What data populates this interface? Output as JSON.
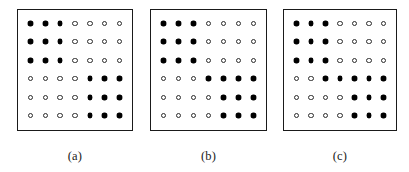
{
  "figure": {
    "marker_filled_name": "filled-dot",
    "marker_open_name": "open-dot",
    "colors": {
      "background": "#ffffff",
      "border": "#1a1a1a",
      "filled_marker": "#000000",
      "open_marker_outline": "#2b2b2b",
      "caption_text": "#1a1a1a"
    }
  },
  "chart_data": {
    "type": "heatmap",
    "title": "",
    "xlabel": "",
    "ylabel": "",
    "grid": false,
    "legend": {
      "position": "none",
      "entries": [
        {
          "symbol": "filled-dot",
          "value": 1
        },
        {
          "symbol": "open-dot",
          "value": 0
        }
      ]
    },
    "columns": 7,
    "rows": 6,
    "value_meaning": "1 = filled marker, 0 = open marker",
    "panels": [
      {
        "caption": "(a)",
        "matrix": [
          [
            1,
            1,
            1,
            0,
            0,
            0,
            0
          ],
          [
            1,
            1,
            1,
            0,
            0,
            0,
            0
          ],
          [
            1,
            1,
            1,
            0,
            0,
            0,
            0
          ],
          [
            0,
            0,
            0,
            0,
            1,
            1,
            1
          ],
          [
            0,
            0,
            0,
            0,
            1,
            1,
            1
          ],
          [
            0,
            0,
            0,
            0,
            1,
            1,
            1
          ]
        ]
      },
      {
        "caption": "(b)",
        "matrix": [
          [
            1,
            1,
            1,
            0,
            0,
            0,
            0
          ],
          [
            1,
            1,
            1,
            0,
            0,
            0,
            0
          ],
          [
            1,
            1,
            1,
            0,
            0,
            0,
            0
          ],
          [
            0,
            0,
            0,
            1,
            1,
            1,
            1
          ],
          [
            0,
            0,
            0,
            0,
            1,
            1,
            1
          ],
          [
            0,
            0,
            0,
            0,
            1,
            1,
            1
          ]
        ]
      },
      {
        "caption": "(c)",
        "matrix": [
          [
            1,
            1,
            1,
            0,
            0,
            0,
            0
          ],
          [
            1,
            1,
            1,
            0,
            0,
            0,
            0
          ],
          [
            1,
            1,
            1,
            0,
            0,
            0,
            0
          ],
          [
            0,
            0,
            1,
            1,
            1,
            1,
            1
          ],
          [
            0,
            0,
            0,
            0,
            1,
            1,
            1
          ],
          [
            0,
            0,
            0,
            0,
            1,
            1,
            1
          ]
        ]
      }
    ]
  }
}
